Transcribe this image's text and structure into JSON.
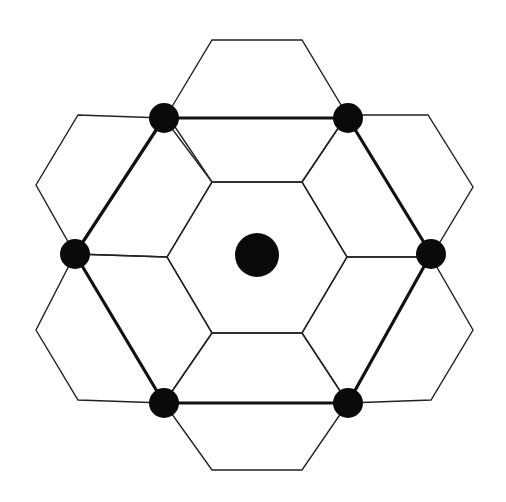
{
  "diagram": {
    "title": "",
    "colors": {
      "background": "#ffffff",
      "thin_line": "#222222",
      "bold_line": "#111111",
      "dot": "#0a0a0a"
    },
    "hexagons": [
      {
        "name": "center",
        "points": "167,257 212,182 302,182 347,257 302,333 212,333"
      },
      {
        "name": "top",
        "points": "167,115 212,40 302,40 347,115 302,182 212,182"
      },
      {
        "name": "upper-right",
        "points": "302,182 347,115 428,115 473,187 431,257 347,257"
      },
      {
        "name": "lower-right",
        "points": "347,257 431,257 473,330 431,400 348,403 302,333"
      },
      {
        "name": "bottom",
        "points": "212,333 302,333 348,403 302,470 212,470 164,403"
      },
      {
        "name": "lower-left",
        "points": "75,254 167,257 212,333 164,403 78,400 36,330"
      },
      {
        "name": "upper-left",
        "points": "78,115 164,118 212,182 167,257 75,254 36,185"
      }
    ],
    "bold_hexagon": {
      "points": "164,118 348,118 431,254 348,403 164,403 75,254"
    },
    "center_dot": {
      "cx": 257,
      "cy": 255,
      "r": 22
    },
    "vertex_dots": [
      {
        "cx": 164,
        "cy": 118,
        "r": 15
      },
      {
        "cx": 348,
        "cy": 118,
        "r": 15
      },
      {
        "cx": 431,
        "cy": 254,
        "r": 15
      },
      {
        "cx": 348,
        "cy": 403,
        "r": 15
      },
      {
        "cx": 164,
        "cy": 403,
        "r": 15
      },
      {
        "cx": 75,
        "cy": 254,
        "r": 15
      }
    ]
  }
}
